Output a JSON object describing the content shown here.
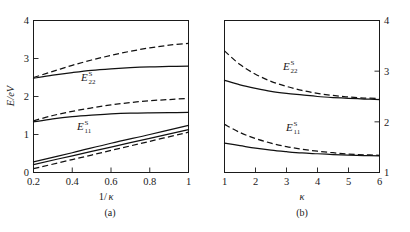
{
  "chart_data": [
    {
      "type": "line",
      "panel": "a",
      "caption": "(a)",
      "title": "",
      "xlabel": "1/κ",
      "ylabel": "E/eV",
      "xlim": [
        0.2,
        1.0
      ],
      "ylim": [
        0,
        4
      ],
      "xticks": [
        0.2,
        0.4,
        0.6,
        0.8,
        1.0
      ],
      "xticklabels": [
        "0.2",
        "0.4",
        "0.6",
        "0.8",
        "1"
      ],
      "yticks": [
        0,
        1,
        2,
        3,
        4
      ],
      "yticklabels": [
        "0",
        "1",
        "2",
        "3",
        "4"
      ],
      "grid": false,
      "legend": "none",
      "annotations": [
        {
          "text": "E22S",
          "base": "E",
          "sup": "S",
          "sub": "22",
          "x": 0.48,
          "y": 2.28
        },
        {
          "text": "E11S",
          "base": "E",
          "sup": "S",
          "sub": "11",
          "x": 0.44,
          "y": 0.98
        }
      ],
      "series": [
        {
          "name": "E22 dashed upper",
          "style": "dashed",
          "x": [
            0.2,
            0.3,
            0.4,
            0.5,
            0.6,
            0.7,
            0.8,
            0.9,
            1.0
          ],
          "y": [
            2.5,
            2.66,
            2.82,
            2.96,
            3.08,
            3.19,
            3.28,
            3.35,
            3.4
          ]
        },
        {
          "name": "E22 solid",
          "style": "solid",
          "x": [
            0.2,
            0.3,
            0.4,
            0.5,
            0.6,
            0.7,
            0.8,
            0.9,
            1.0
          ],
          "y": [
            2.48,
            2.56,
            2.63,
            2.69,
            2.73,
            2.76,
            2.78,
            2.79,
            2.8
          ]
        },
        {
          "name": "E11 dashed upper",
          "style": "dashed",
          "x": [
            0.2,
            0.3,
            0.4,
            0.5,
            0.6,
            0.7,
            0.8,
            0.9,
            1.0
          ],
          "y": [
            1.36,
            1.5,
            1.61,
            1.7,
            1.78,
            1.84,
            1.89,
            1.92,
            1.95
          ]
        },
        {
          "name": "E11 solid upper",
          "style": "solid",
          "x": [
            0.2,
            0.3,
            0.4,
            0.5,
            0.6,
            0.7,
            0.8,
            0.9,
            1.0
          ],
          "y": [
            1.33,
            1.41,
            1.47,
            1.51,
            1.54,
            1.56,
            1.57,
            1.575,
            1.58
          ]
        },
        {
          "name": "lower solid A",
          "style": "solid",
          "x": [
            0.2,
            0.4,
            0.6,
            0.8,
            1.0
          ],
          "y": [
            0.28,
            0.52,
            0.77,
            1.0,
            1.24
          ]
        },
        {
          "name": "lower solid B",
          "style": "solid",
          "x": [
            0.2,
            0.4,
            0.6,
            0.8,
            1.0
          ],
          "y": [
            0.21,
            0.44,
            0.67,
            0.9,
            1.13
          ]
        },
        {
          "name": "lower dashed",
          "style": "dashed",
          "x": [
            0.2,
            0.4,
            0.6,
            0.8,
            1.0
          ],
          "y": [
            0.1,
            0.34,
            0.58,
            0.82,
            1.06
          ]
        }
      ]
    },
    {
      "type": "line",
      "panel": "b",
      "caption": "(b)",
      "title": "",
      "xlabel": "κ",
      "ylabel": "",
      "xlim": [
        1,
        6
      ],
      "ylim": [
        1,
        4
      ],
      "xticks": [
        1,
        2,
        3,
        4,
        5,
        6
      ],
      "xticklabels": [
        "1",
        "2",
        "3",
        "4",
        "5",
        "6"
      ],
      "yticks": [
        1,
        2,
        3,
        4
      ],
      "yticklabels": [
        "1",
        "2",
        "3",
        "4"
      ],
      "yaxis_side": "right",
      "grid": false,
      "legend": "none",
      "annotations": [
        {
          "text": "E22S",
          "base": "E",
          "sup": "S",
          "sub": "22",
          "x": 2.85,
          "y": 3.02
        },
        {
          "text": "E11S",
          "base": "E",
          "sup": "S",
          "sub": "11",
          "x": 2.95,
          "y": 1.82
        }
      ],
      "series": [
        {
          "name": "E22 dashed",
          "style": "dashed",
          "x": [
            1.0,
            1.5,
            2.0,
            2.5,
            3.0,
            3.5,
            4.0,
            4.5,
            5.0,
            5.5,
            6.0
          ],
          "y": [
            3.4,
            3.13,
            2.94,
            2.8,
            2.7,
            2.62,
            2.56,
            2.52,
            2.49,
            2.47,
            2.46
          ]
        },
        {
          "name": "E22 solid",
          "style": "solid",
          "x": [
            1.0,
            1.5,
            2.0,
            2.5,
            3.0,
            3.5,
            4.0,
            4.5,
            5.0,
            5.5,
            6.0
          ],
          "y": [
            2.82,
            2.73,
            2.66,
            2.6,
            2.56,
            2.53,
            2.5,
            2.48,
            2.465,
            2.45,
            2.44
          ]
        },
        {
          "name": "E11 dashed",
          "style": "dashed",
          "x": [
            1.0,
            1.5,
            2.0,
            2.5,
            3.0,
            3.5,
            4.0,
            4.5,
            5.0,
            5.5,
            6.0
          ],
          "y": [
            1.95,
            1.79,
            1.67,
            1.58,
            1.51,
            1.46,
            1.42,
            1.39,
            1.365,
            1.35,
            1.34
          ]
        },
        {
          "name": "E11 solid",
          "style": "solid",
          "x": [
            1.0,
            1.5,
            2.0,
            2.5,
            3.0,
            3.5,
            4.0,
            4.5,
            5.0,
            5.5,
            6.0
          ],
          "y": [
            1.58,
            1.53,
            1.48,
            1.44,
            1.41,
            1.385,
            1.37,
            1.355,
            1.345,
            1.335,
            1.33
          ]
        }
      ]
    }
  ],
  "panel_a": {
    "ylabel": "E/eV",
    "xlabel_num": "1",
    "xlabel_slash": "/",
    "xlabel_kappa": "κ",
    "caption": "(a)",
    "xticklabels": [
      "0.2",
      "0.4",
      "0.6",
      "0.8",
      "1"
    ],
    "yticklabels": [
      "0",
      "1",
      "2",
      "3",
      "4"
    ],
    "label_e22_base": "E",
    "label_e22_sup": "S",
    "label_e22_sub": "22",
    "label_e11_base": "E",
    "label_e11_sup": "S",
    "label_e11_sub": "11"
  },
  "panel_b": {
    "xlabel_kappa": "κ",
    "caption": "(b)",
    "xticklabels": [
      "1",
      "2",
      "3",
      "4",
      "5",
      "6"
    ],
    "yticklabels": [
      "1",
      "2",
      "3",
      "4"
    ],
    "label_e22_base": "E",
    "label_e22_sup": "S",
    "label_e22_sub": "22",
    "label_e11_base": "E",
    "label_e11_sup": "S",
    "label_e11_sub": "11"
  },
  "colors": {
    "line": "#111111",
    "axis": "#1a1a1a",
    "background": "#ffffff"
  }
}
